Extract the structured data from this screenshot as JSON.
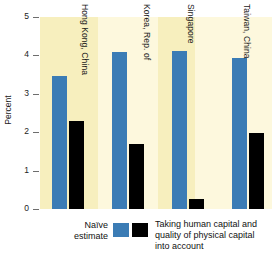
{
  "chart_data": {
    "type": "bar",
    "title": "",
    "xlabel": "",
    "ylabel": "Percent",
    "ylim": [
      0,
      5
    ],
    "yticks": [
      "0",
      "1",
      "2",
      "3",
      "4",
      "5"
    ],
    "grid": false,
    "legend_position": "bottom",
    "categories": [
      "Hong Kong, China",
      "Korea, Rep. of",
      "Singapore",
      "Taiwan, China"
    ],
    "series": [
      {
        "name": "Naïve estimate",
        "color": "#3b7cb5",
        "values": [
          3.46,
          4.08,
          4.11,
          3.93
        ]
      },
      {
        "name": "Taking human capital and quality of physical capital into account",
        "color": "#000000",
        "values": [
          2.28,
          1.7,
          0.26,
          1.99
        ]
      }
    ]
  },
  "axis": {
    "y_label": "Percent",
    "y_ticks": [
      {
        "label": "5",
        "value": 5
      },
      {
        "label": "4",
        "value": 4
      },
      {
        "label": "3",
        "value": 3
      },
      {
        "label": "2",
        "value": 2
      },
      {
        "label": "1",
        "value": 1
      },
      {
        "label": "0",
        "value": 0
      }
    ]
  },
  "categories": [
    {
      "label": "Hong Kong, China"
    },
    {
      "label": "Korea, Rep. of"
    },
    {
      "label": "Singapore"
    },
    {
      "label": "Taiwan, China"
    }
  ],
  "legend": {
    "left_label_line1": "Naïve",
    "left_label_line2": "estimate",
    "right_label_line1": "Taking human capital and",
    "right_label_line2": "quality of physical capital",
    "right_label_line3": "into account",
    "swatch_naive_color": "#3b7cb5",
    "swatch_adjusted_color": "#000000"
  },
  "colors": {
    "band": "#f7efbe",
    "band_pale": "#fdf8dd",
    "naive_bar": "#3b7cb5",
    "adjusted_bar": "#000000",
    "axis": "#6d6d6d",
    "background": "#ffffff"
  }
}
